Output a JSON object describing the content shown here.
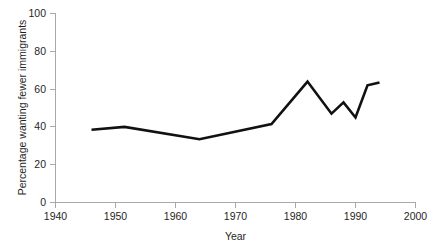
{
  "chart_data": {
    "type": "line",
    "title": "",
    "xlabel": "Year",
    "ylabel": "Percentage wanting fewer immigrants",
    "xlim": [
      1940,
      2000
    ],
    "ylim": [
      0,
      100
    ],
    "xticks": [
      1940,
      1950,
      1960,
      1970,
      1980,
      1990,
      2000
    ],
    "xtick_labels": [
      "1940",
      "1950",
      "1960",
      "1970",
      "1980",
      "1990",
      "2000"
    ],
    "yticks": [
      0,
      20,
      40,
      60,
      80,
      100
    ],
    "ytick_labels": [
      "0",
      "20",
      "40",
      "60",
      "80",
      "100"
    ],
    "grid": false,
    "legend": false,
    "line_color": "#111111",
    "axis_color": "#a9a9a9",
    "series": [
      {
        "name": "Percentage wanting fewer immigrants",
        "x": [
          1946,
          1951.5,
          1964,
          1976,
          1982,
          1986,
          1988,
          1990,
          1992,
          1994
        ],
        "values": [
          38.5,
          40.0,
          33.5,
          41.5,
          64.0,
          47.0,
          53.0,
          45.0,
          62.0,
          63.5
        ]
      }
    ]
  },
  "axes": {
    "x_title": "Year",
    "y_title": "Percentage wanting fewer immigrants"
  }
}
